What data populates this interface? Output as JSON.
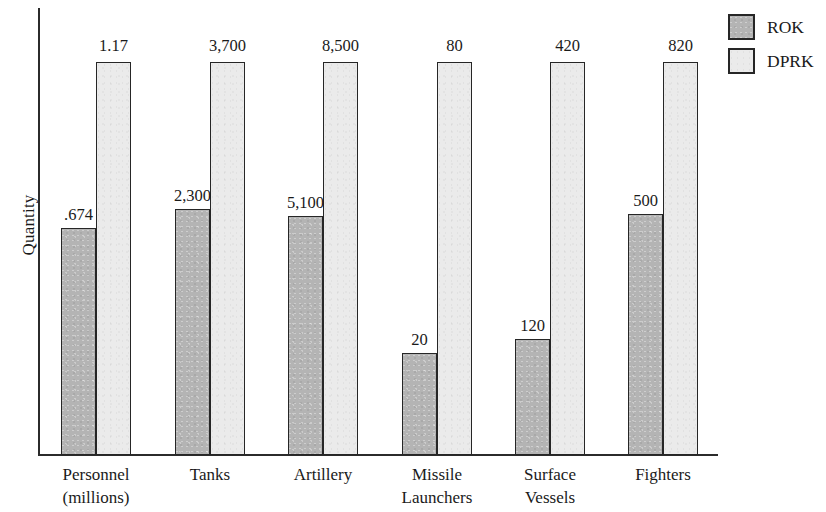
{
  "chart_data": {
    "type": "bar",
    "title": "",
    "xlabel": "",
    "ylabel": "Quantity",
    "grid": false,
    "legend_position": "top-right",
    "categories": [
      "Personnel\n(millions)",
      "Tanks",
      "Artillery",
      "Missile\nLaunchers",
      "Surface\nVessels",
      "Fighters"
    ],
    "category_lines": [
      [
        "Personnel",
        "(millions)"
      ],
      [
        "Tanks",
        ""
      ],
      [
        "Artillery",
        ""
      ],
      [
        "Missile",
        "Launchers"
      ],
      [
        "Surface",
        "Vessels"
      ],
      [
        "Fighters",
        ""
      ]
    ],
    "series": [
      {
        "name": "ROK",
        "color": "#b4b4b4",
        "values": [
          0.674,
          2300,
          5100,
          20,
          120,
          500
        ],
        "value_labels": [
          ".674",
          "2,300",
          "5,100",
          "20",
          "120",
          "500"
        ]
      },
      {
        "name": "DPRK",
        "color": "#ebebeb",
        "values": [
          1.17,
          3700,
          8500,
          80,
          420,
          820
        ],
        "value_labels": [
          "1.17",
          "3,700",
          "8,500",
          "80",
          "420",
          "820"
        ]
      }
    ],
    "note": "Each category is scaled independently; DPRK bars all drawn to full height."
  },
  "legend": {
    "items": [
      {
        "label": "ROK",
        "swatch": "rok-swatch"
      },
      {
        "label": "DPRK",
        "swatch": "dprk-swatch"
      }
    ]
  },
  "axis": {
    "y_title": "Quantity"
  }
}
